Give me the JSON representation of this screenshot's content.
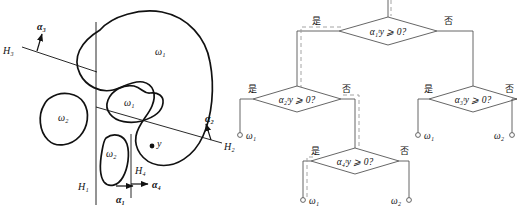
{
  "figure": {
    "panels": [
      {
        "id": "feature-space-partition",
        "name": "left-panel-region-diagram",
        "hyperplanes": [
          {
            "name": "H1",
            "label": "H₁",
            "normal_label": "α₁",
            "normal_name": "alpha-1"
          },
          {
            "name": "H2",
            "label": "H₂",
            "normal_label": "α₂",
            "normal_name": "alpha-2"
          },
          {
            "name": "H3",
            "label": "H₃",
            "normal_label": "α₃",
            "normal_name": "alpha-3"
          },
          {
            "name": "H4",
            "label": "H₄",
            "normal_label": "α₄",
            "normal_name": "alpha-4"
          }
        ],
        "regions": [
          {
            "name": "region-omega1-outer",
            "label": "ω₁"
          },
          {
            "name": "region-omega1-inner",
            "label": "ω₁"
          },
          {
            "name": "region-omega2-left",
            "label": "ω₂"
          },
          {
            "name": "region-omega2-lower",
            "label": "ω₂"
          }
        ],
        "sample_point": {
          "name": "test-point-y",
          "label": "y"
        }
      },
      {
        "id": "decision-tree",
        "name": "right-panel-decision-tree",
        "branch_labels": {
          "yes": "是",
          "no": "否"
        },
        "nodes": [
          {
            "id": "n1",
            "name": "decision-node-alpha1",
            "label": "α₁ᵗy ⩾ 0?",
            "level": 1
          },
          {
            "id": "n2",
            "name": "decision-node-alpha2",
            "label": "α₂ᵗy ⩾ 0?",
            "level": 2
          },
          {
            "id": "n3",
            "name": "decision-node-alpha3",
            "label": "α₃ᵗy ⩾ 0?",
            "level": 2
          },
          {
            "id": "n4",
            "name": "decision-node-alpha4",
            "label": "α₄ᵗy ⩾ 0?",
            "level": 3
          }
        ],
        "leaves": [
          {
            "id": "l1",
            "name": "leaf-omega1-a",
            "label": "ω₁",
            "parent": "n2",
            "branch": "是"
          },
          {
            "id": "l2",
            "name": "leaf-omega1-b",
            "label": "ω₁",
            "parent": "n3",
            "branch": "是"
          },
          {
            "id": "l3",
            "name": "leaf-omega2-a",
            "label": "ω₂",
            "parent": "n3",
            "branch": "否"
          },
          {
            "id": "l4",
            "name": "leaf-omega1-c",
            "label": "ω₁",
            "parent": "n4",
            "branch": "是"
          },
          {
            "id": "l5",
            "name": "leaf-omega2-b",
            "label": "ω₂",
            "parent": "n4",
            "branch": "否"
          }
        ],
        "highlighted_path": [
          "n1",
          "是",
          "n2",
          "否",
          "n4",
          "是",
          "l4"
        ]
      }
    ],
    "colors": {
      "stroke": "#111111",
      "thin_stroke": "#555555",
      "highlight": "#9a9a9a",
      "background": "#ffffff"
    }
  }
}
